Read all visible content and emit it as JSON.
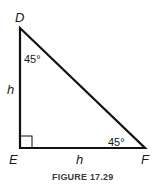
{
  "figure": {
    "caption": "FIGURE 17.29",
    "vertices": {
      "D": {
        "label": "D",
        "x": 20,
        "y": 28
      },
      "E": {
        "label": "E",
        "x": 20,
        "y": 148
      },
      "F": {
        "label": "F",
        "x": 145,
        "y": 148
      }
    },
    "side_labels": {
      "DE": "h",
      "EF": "h"
    },
    "angle_labels": {
      "D": "45°",
      "F": "45°"
    },
    "right_angle_at": "E",
    "colors": {
      "line": "#111111",
      "text": "#1a1a1a",
      "caption": "#3a3a3a"
    }
  }
}
